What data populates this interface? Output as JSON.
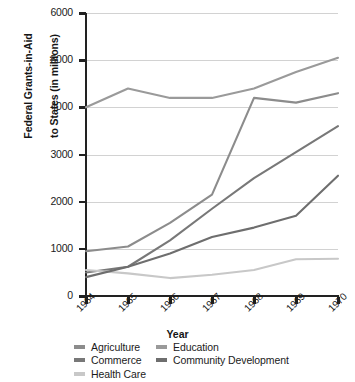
{
  "chart_data": {
    "type": "line",
    "title": "",
    "xlabel": "Year",
    "ylabel": "Federal Grants-in-Aid\nto States (in millions)",
    "categories": [
      "1964",
      "1965",
      "1966",
      "1967",
      "1968",
      "1969",
      "1970"
    ],
    "x": [
      1964,
      1965,
      1966,
      1967,
      1968,
      1969,
      1970
    ],
    "ylim": [
      0,
      6000
    ],
    "yticks": [
      0,
      1000,
      2000,
      3000,
      4000,
      5000,
      6000
    ],
    "ytick_labels": [
      "0",
      "1000",
      "2000",
      "3000",
      "4000",
      "5000",
      "6000"
    ],
    "grid": "horizontal",
    "legend_position": "below-axis",
    "series": [
      {
        "name": "Agriculture",
        "color": "#8c8c8c",
        "values": [
          950,
          1050,
          1550,
          2150,
          4200,
          4100,
          4300
        ]
      },
      {
        "name": "Commerce",
        "color": "#787878",
        "values": [
          500,
          620,
          1180,
          1850,
          2500,
          3050,
          3600
        ]
      },
      {
        "name": "Health Care",
        "color": "#c8c8c8",
        "values": [
          550,
          480,
          380,
          450,
          550,
          780,
          790
        ]
      },
      {
        "name": "Education",
        "color": "#9a9a9a",
        "values": [
          4000,
          4400,
          4200,
          4200,
          4400,
          4750,
          5050
        ]
      },
      {
        "name": "Community Development",
        "color": "#6e6e6e",
        "values": [
          400,
          620,
          900,
          1250,
          1450,
          1700,
          2550
        ]
      }
    ]
  },
  "axes": {
    "y_title_line1": "Federal Grants-in-Aid",
    "y_title_line2": "to States (in millions)",
    "x_title": "Year"
  },
  "legend": {
    "column1": [
      {
        "label": "Agriculture",
        "color": "#8c8c8c"
      },
      {
        "label": "Commerce",
        "color": "#787878"
      },
      {
        "label": "Health Care",
        "color": "#c8c8c8"
      }
    ],
    "column2": [
      {
        "label": "Education",
        "color": "#9a9a9a"
      },
      {
        "label": "Community Development",
        "color": "#6e6e6e"
      }
    ]
  }
}
